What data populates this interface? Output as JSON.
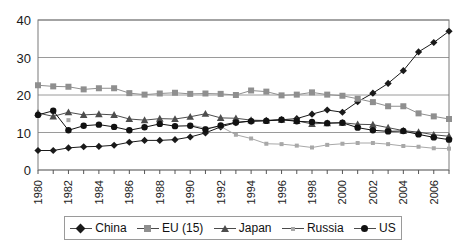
{
  "chart_data": {
    "type": "line",
    "title": "",
    "xlabel": "",
    "ylabel": "",
    "ylim": [
      0,
      40
    ],
    "yticks": [
      0,
      10,
      20,
      30,
      40
    ],
    "grid": true,
    "legend_position": "bottom",
    "x": [
      1980,
      1981,
      1982,
      1983,
      1984,
      1985,
      1986,
      1987,
      1988,
      1989,
      1990,
      1991,
      1992,
      1993,
      1994,
      1995,
      1996,
      1997,
      1998,
      1999,
      2000,
      2001,
      2002,
      2003,
      2004,
      2005,
      2006,
      2007
    ],
    "xtick_labels": [
      "1980",
      "",
      "1982",
      "",
      "1984",
      "",
      "1986",
      "",
      "1988",
      "",
      "1990",
      "",
      "1992",
      "",
      "1994",
      "",
      "1996",
      "",
      "1998",
      "",
      "2000",
      "",
      "2002",
      "",
      "2004",
      "",
      "2006",
      ""
    ],
    "series": [
      {
        "name": "China",
        "marker": "diamond",
        "color": "#1a1a1a",
        "values": [
          5.2,
          5.2,
          5.9,
          6.2,
          6.3,
          6.6,
          7.4,
          7.9,
          7.9,
          8.1,
          8.8,
          9.9,
          11.5,
          12.6,
          13.1,
          13.2,
          13.4,
          13.7,
          14.9,
          16.0,
          15.4,
          18.2,
          20.5,
          23.1,
          26.5,
          31.5,
          34.0,
          37.0
        ]
      },
      {
        "name": "EU (15)",
        "marker": "square",
        "color": "#8f8f8f",
        "values": [
          22.6,
          22.3,
          22.2,
          21.5,
          21.8,
          21.8,
          20.5,
          20.1,
          20.4,
          20.6,
          20.3,
          20.4,
          20.3,
          20.0,
          21.2,
          20.9,
          19.9,
          20.1,
          20.7,
          20.1,
          19.8,
          19.0,
          18.1,
          17.0,
          17.0,
          15.1,
          14.3,
          13.6
        ]
      },
      {
        "name": "Japan",
        "marker": "triangle",
        "color": "#4d4d4d",
        "values": [
          15.2,
          14.3,
          15.4,
          14.7,
          14.9,
          14.7,
          13.6,
          13.3,
          13.7,
          13.6,
          14.2,
          15.0,
          13.9,
          13.8,
          13.3,
          13.2,
          13.4,
          13.1,
          12.3,
          12.5,
          12.6,
          12.2,
          12.1,
          11.3,
          10.5,
          10.1,
          9.4,
          9.0
        ]
      },
      {
        "name": "Russia",
        "marker": "small-square",
        "color": "#a8a8a8",
        "values": [
          null,
          null,
          13.3,
          null,
          null,
          null,
          null,
          null,
          null,
          null,
          12.0,
          11.2,
          11.6,
          9.4,
          8.4,
          7.0,
          6.9,
          6.5,
          6.0,
          6.7,
          7.0,
          7.2,
          7.2,
          6.9,
          6.4,
          6.2,
          5.8,
          5.7
        ]
      },
      {
        "name": "US",
        "marker": "circle",
        "color": "#111111",
        "values": [
          14.7,
          15.8,
          10.6,
          11.8,
          12.1,
          11.5,
          10.6,
          11.4,
          12.3,
          11.7,
          11.8,
          10.8,
          11.9,
          12.7,
          13.0,
          13.1,
          13.4,
          13.0,
          12.8,
          12.5,
          12.6,
          11.3,
          10.6,
          10.3,
          10.4,
          9.5,
          8.7,
          8.1
        ]
      }
    ]
  },
  "legend": {
    "items": [
      {
        "label": "China"
      },
      {
        "label": "EU (15)"
      },
      {
        "label": "Japan"
      },
      {
        "label": "Russia"
      },
      {
        "label": "US"
      }
    ]
  }
}
